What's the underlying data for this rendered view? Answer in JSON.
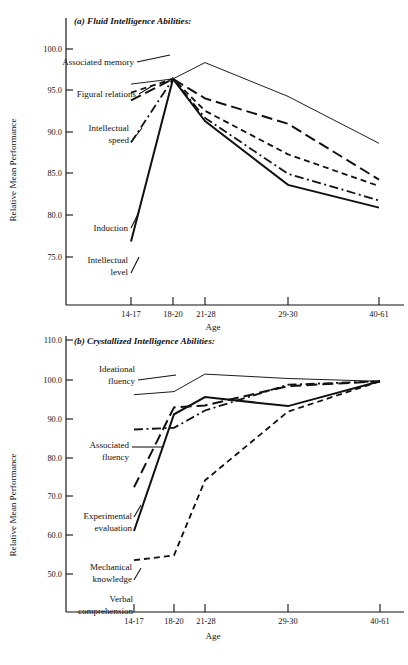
{
  "figure": {
    "y_axis_title": "Relative Mean Performance",
    "x_axis_title": "Age"
  },
  "chart_data": [
    {
      "type": "line",
      "panel": "a",
      "title": "(a) Fluid Intelligence Abilities:",
      "xlabel": "Age",
      "ylabel": "Relative Mean Performance",
      "categories": [
        "14-17",
        "18-20",
        "21-28",
        "29-30",
        "40-61"
      ],
      "xtick_labels": [
        "14-17",
        "18-20",
        "21-28",
        "29-30",
        "40-61"
      ],
      "ytick_labels": [
        "100.0",
        "95.0",
        "90.0",
        "85.0",
        "80.0",
        "75.0"
      ],
      "ylim": [
        72.0,
        104.0
      ],
      "yticks": [
        100.0,
        95.0,
        90.0,
        85.0,
        80.0,
        75.0
      ],
      "grid": false,
      "legend": "inline-labels",
      "series": [
        {
          "name": "Associated memory",
          "linestyle": "solid-thin",
          "values": [
            98.6,
            99.4,
            101.9,
            96.7,
            89.5
          ]
        },
        {
          "name": "Figural relations",
          "linestyle": "long-dash",
          "values": [
            96.1,
            99.4,
            96.4,
            92.5,
            83.9
          ]
        },
        {
          "name": "Intellectual speed",
          "linestyle": "short-dash",
          "values": [
            97.3,
            99.4,
            94.5,
            87.8,
            82.9
          ]
        },
        {
          "name": "Induction",
          "linestyle": "dash-dot",
          "values": [
            89.6,
            99.4,
            93.4,
            84.8,
            80.7
          ]
        },
        {
          "name": "Intellectual level",
          "linestyle": "solid-thick",
          "values": [
            74.4,
            99.4,
            92.9,
            83.1,
            79.6
          ]
        }
      ],
      "annotations": [
        {
          "text": "Associated",
          "text2": "memory"
        },
        {
          "text": "Figural relations"
        },
        {
          "text": "Intellectual",
          "text2": "speed"
        },
        {
          "text": "Induction"
        },
        {
          "text": "Intellectual",
          "text2": "level"
        }
      ]
    },
    {
      "type": "line",
      "panel": "b",
      "title": "(b) Crystallized Intelligence Abilities:",
      "xlabel": "Age",
      "ylabel": "Relative Mean Performance",
      "categories": [
        "14-17",
        "18-20",
        "21-28",
        "29-30",
        "40-61"
      ],
      "xtick_labels": [
        "14-17",
        "18-20",
        "21-28",
        "29-30",
        "40-61"
      ],
      "ytick_labels": [
        "110.0",
        "100.0",
        "90.0",
        "80.0",
        "70.0",
        "60.0",
        "50.0"
      ],
      "ylim": [
        44.0,
        112.0
      ],
      "yticks": [
        110.0,
        100.0,
        90.0,
        80.0,
        70.0,
        60.0,
        50.0
      ],
      "grid": false,
      "legend": "inline-labels",
      "series": [
        {
          "name": "Ideational fluency",
          "linestyle": "solid-thin",
          "values": [
            96.1,
            97.0,
            102.1,
            100.8,
            100.0
          ]
        },
        {
          "name": "Associated fluency",
          "linestyle": "long-dash",
          "values": [
            69.2,
            92.4,
            93.0,
            98.6,
            100.0
          ]
        },
        {
          "name": "Experimental evaluation",
          "linestyle": "dash-dot",
          "values": [
            86.0,
            86.5,
            91.5,
            99.0,
            100.0
          ]
        },
        {
          "name": "Mechanical knowledge",
          "linestyle": "solid-thick",
          "values": [
            56.5,
            90.4,
            95.4,
            92.8,
            100.0
          ]
        },
        {
          "name": "Verbal comprehension",
          "linestyle": "short-dash",
          "values": [
            48.0,
            49.4,
            71.2,
            91.2,
            100.0
          ]
        }
      ],
      "annotations": [
        {
          "text": "Ideational",
          "text2": "fluency"
        },
        {
          "text": "Associated",
          "text2": "fluency"
        },
        {
          "text": "Experimental",
          "text2": "evaluation"
        },
        {
          "text": "Mechanical",
          "text2": "knowledge"
        },
        {
          "text": "Verbal",
          "text2": "comprehension"
        }
      ]
    }
  ]
}
